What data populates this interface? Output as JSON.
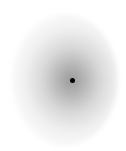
{
  "canvas": {
    "width": 126,
    "height": 151,
    "background": "#ffffff"
  },
  "blob": {
    "shape": "radial-gradient",
    "center_color": "#787878",
    "edge_color": "#ffffff"
  },
  "center_dot": {
    "color": "#000000",
    "x": 72,
    "y": 80
  }
}
